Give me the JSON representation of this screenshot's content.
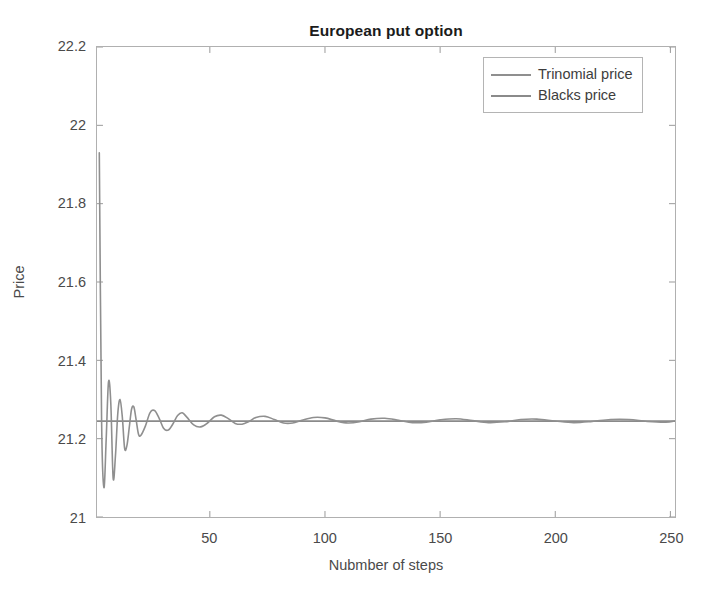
{
  "chart_data": {
    "type": "line",
    "title": "European put option",
    "xlabel": "Nubmber of steps",
    "ylabel": "Price",
    "xlim": [
      1,
      252
    ],
    "ylim": [
      21,
      22.2
    ],
    "xticks": [
      50,
      100,
      150,
      200,
      250
    ],
    "xtick_labels": [
      "50",
      "100",
      "150",
      "200",
      "250"
    ],
    "yticks": [
      21,
      21.2,
      21.4,
      21.6,
      21.8,
      22,
      22.2
    ],
    "ytick_labels": [
      "21",
      "21.2",
      "21.4",
      "21.6",
      "21.8",
      "22",
      "22.2"
    ],
    "grid": false,
    "legend_position": "top-right",
    "legend": [
      "Trinomial price",
      "Blacks price"
    ],
    "series": [
      {
        "name": "Trinomial price",
        "color": "#8f8f8f",
        "width": 1.6,
        "note": "Damped oscillation converging to the Black-Scholes value 21.245",
        "x": [
          2,
          3,
          4,
          5,
          6,
          7,
          8,
          9,
          10,
          11,
          12,
          13,
          14,
          15,
          16,
          17,
          18,
          19,
          20,
          22,
          24,
          26,
          28,
          30,
          32,
          34,
          36,
          38,
          40,
          43,
          46,
          49,
          52,
          55,
          58,
          61,
          64,
          67,
          70,
          74,
          78,
          82,
          86,
          90,
          95,
          100,
          105,
          110,
          115,
          120,
          126,
          132,
          138,
          144,
          150,
          157,
          164,
          171,
          178,
          185,
          192,
          200,
          208,
          216,
          224,
          232,
          240,
          248,
          252
        ],
        "y": [
          21.93,
          21.245,
          21.075,
          21.2,
          21.345,
          21.29,
          21.1,
          21.155,
          21.262,
          21.3,
          21.255,
          21.175,
          21.183,
          21.228,
          21.275,
          21.281,
          21.248,
          21.212,
          21.208,
          21.232,
          21.266,
          21.272,
          21.252,
          21.226,
          21.222,
          21.238,
          21.259,
          21.266,
          21.255,
          21.235,
          21.23,
          21.24,
          21.256,
          21.26,
          21.251,
          21.239,
          21.237,
          21.244,
          21.254,
          21.257,
          21.249,
          21.24,
          21.24,
          21.247,
          21.254,
          21.253,
          21.245,
          21.24,
          21.243,
          21.25,
          21.252,
          21.247,
          21.241,
          21.242,
          21.248,
          21.251,
          21.246,
          21.241,
          21.243,
          21.249,
          21.25,
          21.245,
          21.241,
          21.244,
          21.249,
          21.249,
          21.244,
          21.242,
          21.245
        ]
      },
      {
        "name": "Blacks price",
        "color": "#8a8a8a",
        "width": 1.7,
        "note": "Constant Black-Scholes analytic price",
        "x": [
          1,
          252
        ],
        "y": [
          21.245,
          21.245
        ]
      }
    ]
  },
  "chart": {
    "title": "European put option",
    "xlabel": "Nubmber of steps",
    "ylabel": "Price",
    "legend": [
      {
        "label": "Trinomial price",
        "color": "#8f8f8f"
      },
      {
        "label": "Blacks price",
        "color": "#8a8a8a"
      }
    ],
    "axes": {
      "border_color": "#b0b0b0",
      "tick_color": "#9a9a9a",
      "label_color": "#4a4a4a"
    },
    "background": "#ffffff"
  }
}
